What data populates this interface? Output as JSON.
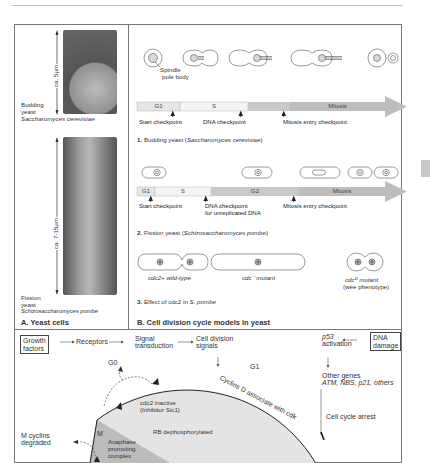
{
  "panel_a": {
    "title": "A. Yeast cells",
    "budding": {
      "scale": "ca. 5µm",
      "label_line1": "Budding",
      "label_line2": "yeast",
      "species": "Saccharomyces cerevisiae"
    },
    "fission": {
      "scale": "ca. 7-15µm",
      "label_line1": "Fission",
      "label_line2": "yeast",
      "species": "Schizosaccharomyces pombe"
    }
  },
  "panel_b": {
    "title": "B. Cell division cycle models in yeast",
    "model1": {
      "spindle_label_line1": "Spindle",
      "spindle_label_line2": "pole body",
      "phases": [
        "G1",
        "S",
        "",
        "Mitosis"
      ],
      "checkpoints": [
        "Start checkpoint",
        "DNA checkpoint",
        "Mitosis entry checkpoint"
      ],
      "caption_num": "1.",
      "caption": "Budding yeast (",
      "caption_species": "Saccharomyces cerevisiae",
      "caption_end": ")"
    },
    "model2": {
      "phases": [
        "G1",
        "S",
        "G2",
        "Mitosis"
      ],
      "checkpoints": [
        "Start checkpoint",
        "DNA checkpoint",
        "for unreplicated DNA",
        "Mitosis entry checkpoint"
      ],
      "caption_num": "2.",
      "caption": "Fission yeast (",
      "caption_species": "Schizosaccharomyces pombe",
      "caption_end": ")"
    },
    "model3": {
      "wild_type": "cdc2+ wild-type",
      "mutant": "cdc⁻ mutant",
      "wee_mutant": "cdcᴰ mutant",
      "wee_phenotype": "(wee phenotype)",
      "caption_num": "3.",
      "caption": "Effect of cdc2 in ",
      "caption_species": "S. pombe"
    }
  },
  "panel_c": {
    "flow": [
      "Growth factors",
      "Receptors",
      "Signal transduction",
      "Cell division signals"
    ],
    "growth_line1": "Growth",
    "growth_line2": "factors",
    "receptors": "Receptors",
    "signal_line1": "Signal",
    "signal_line2": "transduction",
    "division_line1": "Cell division",
    "division_line2": "signals",
    "g1": "G1",
    "g0": "G0",
    "m": "M",
    "cyclins_d": "Cyclins D associate with cdk",
    "cdc2_inactive": "cdc2 inactive",
    "inhibitor": "(Inhibitor Sic1)",
    "rb": "RB dephosphorylated",
    "apc_line1": "Anaphase",
    "apc_line2": "promoting",
    "apc_line3": "complex",
    "m_cyclins_line1": "M cyclins",
    "m_cyclins_line2": "degraded",
    "p53_line1": "p53",
    "p53_line2": "activation",
    "dna_damage_line1": "DNA",
    "dna_damage_line2": "damage",
    "other_genes": "Other genes",
    "genes_list": "ATM, NBS, p21, others",
    "arrest": "Cell cycle arrest"
  },
  "colors": {
    "g1_bar": "#e6e6e6",
    "s_bar": "#f3f3f3",
    "g2_bar": "#c9c9c9",
    "mitosis_bar": "#bdbdbd",
    "wheel": "#e4e4e4",
    "apc": "#bcbcbc",
    "frame": "#777777"
  }
}
